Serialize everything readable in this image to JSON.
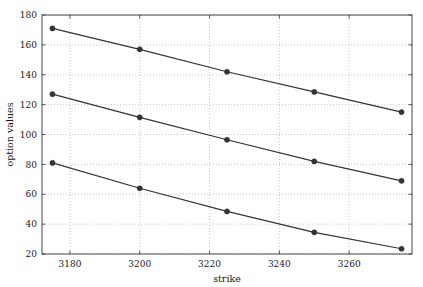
{
  "chart_data": {
    "type": "line",
    "title": "",
    "subtitle": "",
    "xlabel": "strike",
    "ylabel": "option values",
    "x": [
      3175,
      3200,
      3225,
      3250,
      3275
    ],
    "xlim": [
      3172,
      3278
    ],
    "ylim": [
      20,
      180
    ],
    "xticks": [
      3180,
      3200,
      3220,
      3240,
      3260
    ],
    "yticks": [
      20,
      40,
      60,
      80,
      100,
      120,
      140,
      160,
      180
    ],
    "xtick_labels": [
      "3180",
      "3200",
      "3220",
      "3240",
      "3260"
    ],
    "ytick_labels": [
      "20",
      "40",
      "60",
      "80",
      "100",
      "120",
      "140",
      "160",
      "180"
    ],
    "grid": true,
    "grid_style": "dotted",
    "grid_color": "#b0b0b0",
    "legend": "none",
    "marker": "filled-circle",
    "line_color": "#333333",
    "marker_color": "#333333",
    "background": "#ffffff",
    "frame_color": "#555555",
    "series": [
      {
        "name": "series-1",
        "values": [
          171.0,
          157.0,
          142.0,
          128.5,
          115.0
        ]
      },
      {
        "name": "series-2",
        "values": [
          127.0,
          111.5,
          96.5,
          82.0,
          69.0
        ]
      },
      {
        "name": "series-3",
        "values": [
          81.0,
          64.0,
          48.5,
          34.5,
          23.5
        ]
      }
    ]
  },
  "axes": {
    "x_title": "strike",
    "y_title": "option values"
  }
}
